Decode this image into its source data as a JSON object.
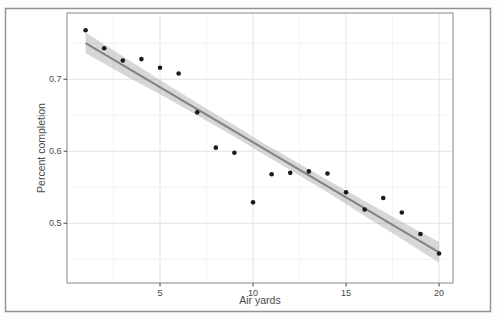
{
  "figure": {
    "title": "",
    "xlabel": "Air yards",
    "ylabel": "Percent completion"
  },
  "chart_data": {
    "type": "scatter",
    "title": "",
    "xlabel": "Air yards",
    "ylabel": "Percent completion",
    "xlim": [
      0,
      20.75
    ],
    "ylim": [
      0.417,
      0.792
    ],
    "grid": true,
    "legend": "none",
    "x_ticks": {
      "values": [
        5,
        10,
        15,
        20
      ],
      "labels": [
        "5",
        "10",
        "15",
        "20"
      ]
    },
    "y_ticks": {
      "values": [
        0.5,
        0.6,
        0.7
      ],
      "labels": [
        "0.5",
        "0.6",
        "0.7"
      ]
    },
    "x_minor_gridlines": [
      2.5,
      7.5,
      12.5,
      17.5
    ],
    "y_minor_gridlines": [
      0.45,
      0.55,
      0.65,
      0.75
    ],
    "points": {
      "x": [
        1,
        2,
        3,
        4,
        5,
        6,
        7,
        8,
        9,
        10,
        11,
        12,
        13,
        14,
        15,
        16,
        17,
        18,
        19,
        20
      ],
      "y": [
        0.768,
        0.743,
        0.726,
        0.728,
        0.716,
        0.708,
        0.654,
        0.605,
        0.598,
        0.529,
        0.568,
        0.57,
        0.572,
        0.569,
        0.543,
        0.519,
        0.535,
        0.515,
        0.485,
        0.458
      ]
    },
    "trend": {
      "type": "linear",
      "intercept": 0.7655,
      "slope": -0.0153,
      "x_start": 1,
      "x_end": 20
    },
    "ci_ribbon": {
      "x": [
        1,
        3,
        5,
        7,
        9,
        10.5,
        12,
        14,
        16,
        18,
        20
      ],
      "upper": [
        0.765,
        0.732,
        0.699,
        0.667,
        0.636,
        0.612,
        0.59,
        0.56,
        0.531,
        0.502,
        0.474
      ],
      "lower": [
        0.736,
        0.707,
        0.679,
        0.65,
        0.62,
        0.597,
        0.574,
        0.543,
        0.51,
        0.478,
        0.445
      ]
    },
    "colors": {
      "point": "#1a1a1a",
      "trend_line": "#848484",
      "ci_ribbon": "rgba(150,150,150,0.38)",
      "grid_major": "#e3e3e3",
      "grid_minor": "#f2f2f2",
      "panel_border": "#a3a3a3",
      "panel_background": "#ffffff",
      "frame_border": "#979290",
      "axis_text": "#4a4a4a",
      "tick_mark": "#444444"
    }
  }
}
